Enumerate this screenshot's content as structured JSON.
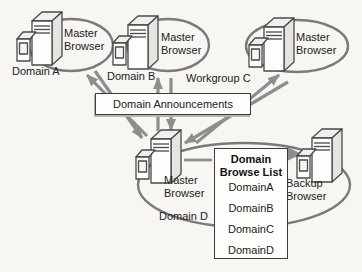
{
  "nodes": {
    "domain_a": {
      "label": "Domain A",
      "browser": "Master Browser"
    },
    "domain_b": {
      "label": "Domain B",
      "browser": "Master Browser"
    },
    "workgroup_c": {
      "label": "Workgroup C",
      "browser": "Master Browser"
    },
    "domain_d": {
      "label": "Domain D",
      "master": "Master Browser",
      "backup": "Backup Browser"
    }
  },
  "announcements": {
    "label": "Domain Announcements"
  },
  "browse_list": {
    "title": "Domain Browse List",
    "items": [
      "DomainA",
      "DomainB",
      "DomainC",
      "DomainD"
    ]
  },
  "colors": {
    "arrow": "#8e8e8e",
    "ellipse": "#7a7a7a",
    "box_border": "#3c3c3c",
    "text": "#222222",
    "background": "#f7f6f3"
  }
}
